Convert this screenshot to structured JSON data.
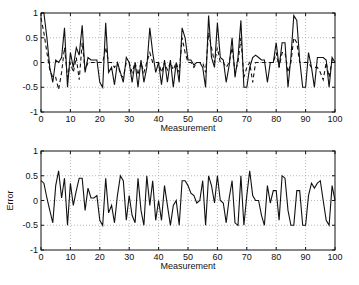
{
  "chart_data": [
    {
      "type": "line",
      "title": "",
      "xlabel": "Measurement",
      "ylabel": "",
      "xlim": [
        0,
        100
      ],
      "ylim": [
        -1,
        1
      ],
      "xticks": [
        0,
        10,
        20,
        30,
        40,
        50,
        60,
        70,
        80,
        90,
        100
      ],
      "yticks": [
        -1,
        -0.5,
        0,
        0.5,
        1
      ],
      "ytick_labels": [
        "-1",
        "-0.5",
        "0",
        "0.5",
        "1"
      ],
      "grid": true,
      "legend": null,
      "series": [
        {
          "name": "solid",
          "style": "solid",
          "x": [
            0,
            1,
            2,
            3,
            4,
            5,
            6,
            7,
            8,
            9,
            10,
            11,
            12,
            13,
            14,
            15,
            16,
            17,
            18,
            19,
            20,
            21,
            22,
            23,
            24,
            25,
            26,
            27,
            28,
            29,
            30,
            31,
            32,
            33,
            34,
            35,
            36,
            37,
            38,
            39,
            40,
            41,
            42,
            43,
            44,
            45,
            46,
            47,
            48,
            49,
            50,
            51,
            52,
            53,
            54,
            55,
            56,
            57,
            58,
            59,
            60,
            61,
            62,
            63,
            64,
            65,
            66,
            67,
            68,
            69,
            70,
            71,
            72,
            73,
            74,
            75,
            76,
            77,
            78,
            79,
            80,
            81,
            82,
            83,
            84,
            85,
            86,
            87,
            88,
            89,
            90,
            91,
            92,
            93,
            94,
            95,
            96,
            97,
            98,
            99,
            100
          ],
          "values": [
            1,
            1,
            0.5,
            -0.1,
            -0.4,
            0.05,
            0,
            0.1,
            0.7,
            -0.5,
            0.2,
            -0.1,
            0.3,
            0.15,
            0.75,
            -0.2,
            0.1,
            0.05,
            0.05,
            0.05,
            -0.4,
            -0.5,
            0.8,
            -0.2,
            -0.1,
            -0.45,
            0,
            -0.2,
            -0.4,
            0.1,
            0,
            -0.4,
            0,
            -0.5,
            0.05,
            -0.4,
            -0.1,
            0.7,
            0.2,
            -0.2,
            0,
            -0.45,
            0.05,
            -0.4,
            0.05,
            -0.5,
            0,
            -0.4,
            0.7,
            0.5,
            0.05,
            0.05,
            -0.05,
            0,
            0,
            -0.1,
            -0.5,
            0.95,
            0.1,
            -0.1,
            0.8,
            0.1,
            0.05,
            -0.4,
            -0.05,
            0.5,
            -0.3,
            0.1,
            0.85,
            -0.5,
            -0.5,
            -0.1,
            0.1,
            0.15,
            0.1,
            0.05,
            0.05,
            -0.4,
            0,
            0,
            0.4,
            -0.1,
            0.4,
            0.4,
            -0.5,
            0.1,
            0.95,
            0.85,
            0.05,
            -0.5,
            -0.5,
            0.2,
            -0.1,
            -0.5,
            0.1,
            0.1,
            0.1,
            0.05,
            -0.5,
            0.1,
            0
          ]
        },
        {
          "name": "dashed",
          "style": "dashed",
          "x": [
            0,
            1,
            2,
            3,
            4,
            5,
            6,
            7,
            8,
            9,
            10,
            11,
            12,
            13,
            14,
            15,
            16,
            17,
            18,
            19,
            20,
            21,
            22,
            23,
            24,
            25,
            26,
            27,
            28,
            29,
            30,
            31,
            32,
            33,
            34,
            35,
            36,
            37,
            38,
            39,
            40,
            41,
            42,
            43,
            44,
            45,
            46,
            47,
            48,
            49,
            50,
            51,
            52,
            53,
            54,
            55,
            56,
            57,
            58,
            59,
            60,
            61,
            62,
            63,
            64,
            65,
            66,
            67,
            68,
            69,
            70,
            71,
            72,
            73,
            74,
            75,
            76,
            77,
            78,
            79,
            80,
            81,
            82,
            83,
            84,
            85,
            86,
            87,
            88,
            89,
            90,
            91,
            92,
            93,
            94,
            95,
            96,
            97,
            98,
            99,
            100
          ],
          "values": [
            0.9,
            0.6,
            0.2,
            -0.15,
            -0.3,
            -0.3,
            -0.55,
            -0.2,
            0.3,
            -0.3,
            0,
            -0.2,
            0.1,
            -0.35,
            0.4,
            -0.15,
            0,
            0,
            0,
            0,
            0,
            0,
            0.3,
            0,
            0,
            -0.1,
            0,
            -0.25,
            -0.3,
            0,
            0,
            -0.2,
            0,
            -0.25,
            0,
            -0.2,
            0,
            0.2,
            0,
            0,
            0,
            -0.2,
            0,
            -0.15,
            0,
            -0.15,
            0,
            -0.2,
            0.5,
            0.2,
            0,
            0,
            -0.1,
            0,
            0,
            0,
            -0.2,
            0.6,
            0.3,
            0,
            0.3,
            0,
            0,
            -0.1,
            0,
            0.3,
            -0.2,
            0,
            0.5,
            -0.3,
            -0.1,
            0,
            -0.4,
            0,
            0,
            0,
            0,
            0,
            0,
            0,
            0.2,
            -0.1,
            0.2,
            0.2,
            -0.2,
            0,
            0.5,
            0.4,
            0,
            0,
            0,
            0,
            -0.1,
            -0.1,
            -0.1,
            -0.2,
            -0.35,
            0,
            -0.3,
            0.05,
            0
          ]
        }
      ]
    },
    {
      "type": "line",
      "title": "",
      "xlabel": "Measurement",
      "ylabel": "Error",
      "xlim": [
        0,
        100
      ],
      "ylim": [
        -1,
        1
      ],
      "xticks": [
        0,
        10,
        20,
        30,
        40,
        50,
        60,
        70,
        80,
        90,
        100
      ],
      "yticks": [
        -1,
        -0.5,
        0,
        0.5,
        1
      ],
      "ytick_labels": [
        "-1",
        "-0.5",
        "0",
        "0.5",
        "1"
      ],
      "grid": true,
      "legend": null,
      "series": [
        {
          "name": "error",
          "style": "solid",
          "x": [
            0,
            1,
            2,
            3,
            4,
            5,
            6,
            7,
            8,
            9,
            10,
            11,
            12,
            13,
            14,
            15,
            16,
            17,
            18,
            19,
            20,
            21,
            22,
            23,
            24,
            25,
            26,
            27,
            28,
            29,
            30,
            31,
            32,
            33,
            34,
            35,
            36,
            37,
            38,
            39,
            40,
            41,
            42,
            43,
            44,
            45,
            46,
            47,
            48,
            49,
            50,
            51,
            52,
            53,
            54,
            55,
            56,
            57,
            58,
            59,
            60,
            61,
            62,
            63,
            64,
            65,
            66,
            67,
            68,
            69,
            70,
            71,
            72,
            73,
            74,
            75,
            76,
            77,
            78,
            79,
            80,
            81,
            82,
            83,
            84,
            85,
            86,
            87,
            88,
            89,
            90,
            91,
            92,
            93,
            94,
            95,
            96,
            97,
            98,
            99,
            100
          ],
          "values": [
            0.4,
            0.35,
            0.05,
            -0.2,
            -0.45,
            0.3,
            0.6,
            0.05,
            0.45,
            -0.5,
            0.35,
            -0.1,
            0.2,
            0.45,
            0.45,
            -0.2,
            0.25,
            0.05,
            0.05,
            0.1,
            -0.4,
            -0.5,
            0.45,
            -0.25,
            -0.1,
            -0.45,
            0.1,
            0.5,
            0.4,
            -0.4,
            0.1,
            -0.3,
            -0.45,
            0.45,
            -0.2,
            -0.5,
            0.5,
            -0.1,
            0.4,
            -0.4,
            0,
            -0.4,
            0.3,
            -0.1,
            -0.5,
            -0.1,
            0,
            -0.5,
            0.4,
            0.4,
            0.3,
            0.15,
            0.1,
            -0.05,
            0,
            0.4,
            -0.5,
            0.5,
            0.3,
            -0.05,
            0.5,
            0,
            -0.05,
            -0.45,
            0.05,
            0.4,
            -0.45,
            -0.5,
            0.5,
            -0.5,
            0.1,
            0.6,
            0.1,
            0,
            0,
            -0.3,
            -0.5,
            0.3,
            -0.05,
            0.2,
            0.2,
            -0.4,
            0.5,
            0.45,
            -0.2,
            -0.5,
            -0.5,
            0.2,
            0.2,
            -0.5,
            -0.5,
            0.1,
            0.35,
            0.25,
            0.35,
            0.4,
            0,
            -0.4,
            -0.5,
            0.3,
            0
          ]
        }
      ]
    }
  ],
  "plots": {
    "top": {
      "xlabel": "Measurement"
    },
    "bottom": {
      "xlabel": "Measurement",
      "ylabel": "Error"
    }
  },
  "colors": {
    "line": "#111111",
    "grid": "#999999",
    "axis": "#111111"
  }
}
